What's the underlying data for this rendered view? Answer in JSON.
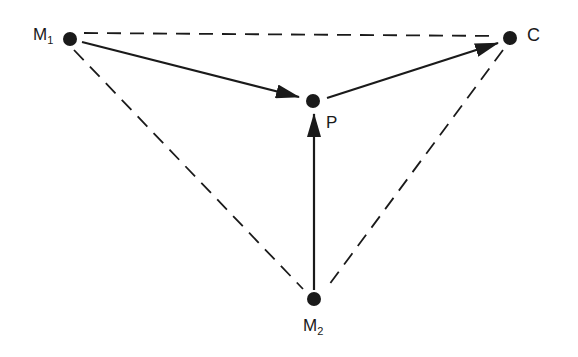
{
  "diagram": {
    "type": "directed-graph",
    "colors": {
      "line": "#1a1a1a",
      "background": "#ffffff"
    },
    "nodes": [
      {
        "id": "M1",
        "label": "M",
        "subscript": "1",
        "x": 70,
        "y": 39
      },
      {
        "id": "C",
        "label": "C",
        "subscript": "",
        "x": 510,
        "y": 38
      },
      {
        "id": "P",
        "label": "P",
        "subscript": "",
        "x": 313,
        "y": 101
      },
      {
        "id": "M2",
        "label": "M",
        "subscript": "2",
        "x": 314,
        "y": 299
      }
    ],
    "edges": [
      {
        "from": "M1",
        "to": "P",
        "style": "solid",
        "arrow": true
      },
      {
        "from": "P",
        "to": "C",
        "style": "solid",
        "arrow": true
      },
      {
        "from": "M2",
        "to": "P",
        "style": "solid",
        "arrow": true
      },
      {
        "from": "M1",
        "to": "C",
        "style": "dashed",
        "arrow": false
      },
      {
        "from": "M1",
        "to": "M2",
        "style": "dashed",
        "arrow": false
      },
      {
        "from": "C",
        "to": "M2",
        "style": "dashed",
        "arrow": false
      }
    ]
  }
}
